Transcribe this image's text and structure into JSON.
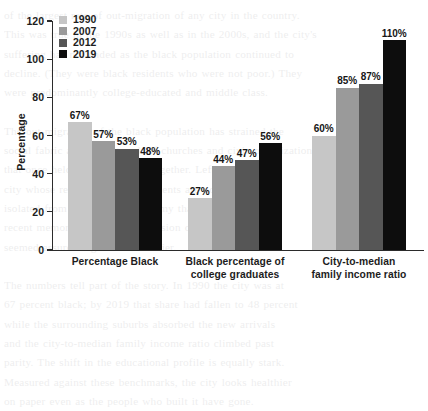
{
  "chart_data": {
    "type": "bar",
    "title": "",
    "subtitle": "",
    "xlabel": "",
    "ylabel": "Percentage",
    "ylim": [
      0,
      120
    ],
    "y_ticks": [
      0,
      20,
      40,
      60,
      80,
      100,
      120
    ],
    "grid": false,
    "legend_position": "top-left",
    "value_suffix": "%",
    "categories": [
      "Percentage Black",
      "Black percentage of college graduates",
      "City-to-median family income ratio"
    ],
    "category_lines": [
      [
        "Percentage Black"
      ],
      [
        "Black percentage of",
        "college graduates"
      ],
      [
        "City-to-median",
        "family income ratio"
      ]
    ],
    "series": [
      {
        "name": "1990",
        "color": "#c6c6c6",
        "values": [
          67,
          27,
          60
        ],
        "labels": [
          "67%",
          "27%",
          "60%"
        ]
      },
      {
        "name": "2007",
        "color": "#9a9a9a",
        "values": [
          57,
          44,
          85
        ],
        "labels": [
          "57%",
          "44%",
          "85%"
        ]
      },
      {
        "name": "2012",
        "color": "#565656",
        "values": [
          53,
          47,
          87
        ],
        "labels": [
          "53%",
          "47%",
          "87%"
        ]
      },
      {
        "name": "2019",
        "color": "#0d0d0d",
        "values": [
          48,
          56,
          110
        ],
        "labels": [
          "48%",
          "56%",
          "110%"
        ]
      }
    ],
    "axis_color": "#2b2b2b",
    "text_color": "#1d1d1d"
  },
  "background_text": "of the largest rate of out-migration of any city in the country.\nThis was true in the 1990s as well as in the 2000s, and the city's\nsuffering has not ended as the black population continued to\ndecline. (They were black residents who were not poor.) They\nwere predominantly college-educated and middle class.\n\nThe out-migration of the black population has strained the\nsocial fabric and the network of churches and civic organizations\nthat once held the community together. Left behind is a\ncity whose remaining black residents are poorer and more\nisolated from the regional economy than at any point in\nrecent memory, a troubling inversion of the progress that\nseemed assured a generation earlier.\n\nThe numbers tell part of the story. In 1990 the city was at\n67 percent black; by 2019 that share had fallen to 48 percent\nwhile the surrounding suburbs absorbed the new arrivals\nand the city-to-median family income ratio climbed past\nparity. The shift in the educational profile is equally stark.\nMeasured against these benchmarks, the city looks healthier\non paper even as the people who built it have gone."
}
